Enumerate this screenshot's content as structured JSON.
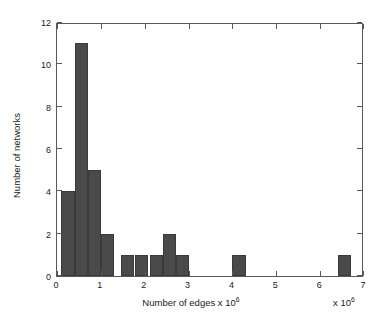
{
  "chart_data": {
    "type": "bar",
    "title": "",
    "xlabel": "Number of edges x 10",
    "xlabel_exponent": "6",
    "ylabel": "Number of networks",
    "x_exponent_annotation_prefix": "x 10",
    "x_exponent_annotation_power": "6",
    "xlim": [
      0,
      7
    ],
    "ylim": [
      0,
      12
    ],
    "xticks": [
      0,
      1,
      2,
      3,
      4,
      5,
      6,
      7
    ],
    "xtick_labels": [
      "0",
      "1",
      "2",
      "3",
      "4",
      "5",
      "6",
      "7"
    ],
    "yticks": [
      0,
      2,
      4,
      6,
      8,
      10,
      12
    ],
    "ytick_labels": [
      "0",
      "2",
      "4",
      "6",
      "8",
      "10",
      "12"
    ],
    "grid": false,
    "legend": null,
    "bar_color": "#4a4a4a",
    "axis_color": "#585858",
    "bin_width": 0.3,
    "bars": [
      {
        "bin_start": 0.1,
        "bin_end": 0.4,
        "center": 0.25,
        "value": 4
      },
      {
        "bin_start": 0.4,
        "bin_end": 0.7,
        "center": 0.55,
        "value": 11
      },
      {
        "bin_start": 0.7,
        "bin_end": 1.0,
        "center": 0.85,
        "value": 5
      },
      {
        "bin_start": 1.0,
        "bin_end": 1.3,
        "center": 1.15,
        "value": 2
      },
      {
        "bin_start": 1.45,
        "bin_end": 1.75,
        "center": 1.6,
        "value": 1
      },
      {
        "bin_start": 1.78,
        "bin_end": 2.08,
        "center": 1.93,
        "value": 1
      },
      {
        "bin_start": 2.11,
        "bin_end": 2.41,
        "center": 2.26,
        "value": 1
      },
      {
        "bin_start": 2.41,
        "bin_end": 2.71,
        "center": 2.56,
        "value": 2
      },
      {
        "bin_start": 2.71,
        "bin_end": 3.0,
        "center": 2.85,
        "value": 1
      },
      {
        "bin_start": 4.0,
        "bin_end": 4.3,
        "center": 4.15,
        "value": 1
      },
      {
        "bin_start": 6.4,
        "bin_end": 6.7,
        "center": 6.55,
        "value": 1
      }
    ]
  }
}
